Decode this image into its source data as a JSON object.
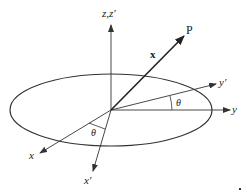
{
  "diagram": {
    "type": "coordinate-rotation",
    "labels": {
      "z_axis": "z,z′",
      "point": "P",
      "vector": "x",
      "y_axis": "y",
      "y_prime_axis": "y′",
      "x_axis": "x",
      "x_prime_axis": "x′",
      "angle_top": "θ",
      "angle_bottom": "θ"
    },
    "colors": {
      "stroke": "#333333",
      "background": "#ffffff"
    }
  }
}
